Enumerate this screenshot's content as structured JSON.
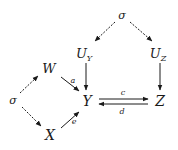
{
  "diagram": {
    "type": "causal-graph",
    "nodes": {
      "sigma_top": {
        "label": "σ"
      },
      "U_Y": {
        "label": "U",
        "subscript": "Y"
      },
      "U_Z": {
        "label": "U",
        "subscript": "Z"
      },
      "W": {
        "label": "W"
      },
      "Y": {
        "label": "Y"
      },
      "Z": {
        "label": "Z"
      },
      "sigma_left": {
        "label": "σ"
      },
      "X": {
        "label": "X"
      }
    },
    "edges": [
      {
        "from": "σ",
        "to": "U_Y",
        "style": "dashed"
      },
      {
        "from": "σ",
        "to": "U_Z",
        "style": "dashed"
      },
      {
        "from": "U_Y",
        "to": "Y",
        "style": "solid"
      },
      {
        "from": "U_Z",
        "to": "Z",
        "style": "solid"
      },
      {
        "from": "σ",
        "to": "W",
        "style": "dashed"
      },
      {
        "from": "σ",
        "to": "X",
        "style": "dashed"
      },
      {
        "from": "W",
        "to": "Y",
        "style": "solid",
        "label": "a"
      },
      {
        "from": "X",
        "to": "Y",
        "style": "solid",
        "label": "e"
      },
      {
        "from": "Y",
        "to": "Z",
        "style": "solid",
        "label": "c"
      },
      {
        "from": "Z",
        "to": "Y",
        "style": "solid",
        "label": "d"
      }
    ],
    "edge_labels": {
      "a": "a",
      "e": "e",
      "c": "c",
      "d": "d"
    },
    "colors": {
      "ink": "#1a1a1a",
      "background": "#ffffff"
    }
  }
}
